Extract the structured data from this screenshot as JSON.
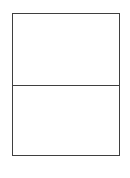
{
  "document": {
    "kind": "blank-two-cell-form",
    "background_color": "#ffffff",
    "border_color": "#3f3f3f",
    "border_width_px": 1.4
  },
  "form": {
    "name": "two-row-table",
    "x": 12,
    "y": 13,
    "width": 108,
    "height": 143,
    "rows": [
      {
        "id": "upper",
        "label": "",
        "content": "",
        "height_px": 73,
        "fill": "#ffffff"
      },
      {
        "id": "lower",
        "label": "",
        "content": "",
        "height_px": 70,
        "fill": "#ffffff"
      }
    ],
    "divider": {
      "name": "row-divider",
      "y": 86,
      "color": "#3f3f3f",
      "thickness_px": 1.4
    }
  }
}
